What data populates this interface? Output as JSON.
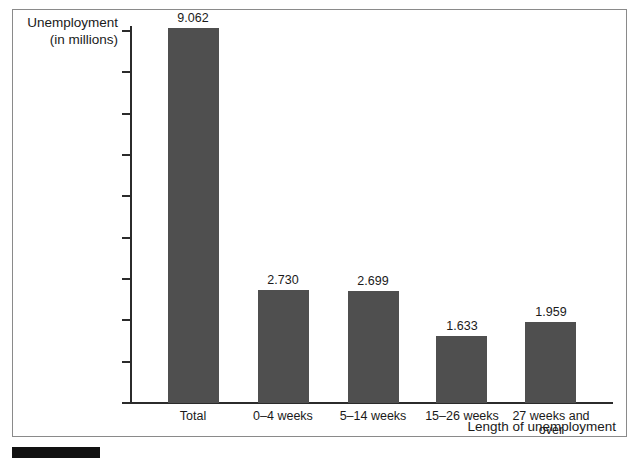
{
  "chart_data": {
    "type": "bar",
    "title": "",
    "xlabel": "Length of unemployment",
    "ylabel": "Unemployment\n(in millions)",
    "ylabel_line1": "Unemployment",
    "ylabel_line2": "(in millions)",
    "categories": [
      "Total",
      "0–4 weeks",
      "5–14 weeks",
      "15–26 weeks",
      "27 weeks and over"
    ],
    "values": [
      9.062,
      2.73,
      2.699,
      1.633,
      1.959
    ],
    "value_labels": [
      "9.062",
      "2.730",
      "2.699",
      "1.633",
      "1.959"
    ],
    "ylim": [
      0,
      9
    ],
    "ytick_labels": [
      "9",
      "8",
      "7",
      "6",
      "5",
      "4",
      "3",
      "2",
      "1",
      "0"
    ],
    "ytick_values": [
      9,
      8,
      7,
      6,
      5,
      4,
      3,
      2,
      1,
      0
    ],
    "grid": false,
    "legend": false,
    "bar_color": "#4f4f4f",
    "axis_color": "#2b2b2b",
    "frame_color": "#8a8a8a",
    "background_color": "#ffffff"
  },
  "figure": {
    "marker_color": "#121212"
  }
}
